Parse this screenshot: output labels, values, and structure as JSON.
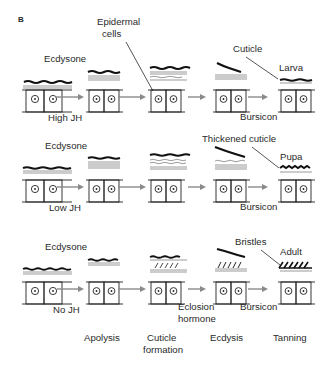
{
  "figure": {
    "panel_label": "B",
    "colors": {
      "ink": "#2a2a2a",
      "arrow": "#8a8a8a",
      "background": "#ffffff"
    }
  },
  "rows": [
    {
      "id": "larva",
      "hormone_label": "Ecdysone",
      "jh_label": "High JH",
      "callout_top": "Epidermal\ncells",
      "callout_top_lines": [
        "Epidermal",
        "cells"
      ],
      "callout_cuticle": "Cuticle",
      "stage_label": "Larva",
      "final_hormone": "Bursicon"
    },
    {
      "id": "pupa",
      "hormone_label": "Ecdysone",
      "jh_label": "Low JH",
      "callout_cuticle": "Thickened cuticle",
      "stage_label": "Pupa",
      "final_hormone": "Bursicon"
    },
    {
      "id": "adult",
      "hormone_label": "Ecdysone",
      "jh_label": "No JH",
      "callout_cuticle": "Bristles",
      "stage_label": "Adult",
      "mid_hormone_lines": [
        "Eclosion",
        "hormone"
      ],
      "final_hormone": "Bursicon"
    }
  ],
  "phases": [
    {
      "label_lines": [
        "Apolysis"
      ]
    },
    {
      "label_lines": [
        "Cuticle",
        "formation"
      ]
    },
    {
      "label_lines": [
        "Ecdysis"
      ]
    },
    {
      "label_lines": [
        "Tanning"
      ]
    }
  ]
}
